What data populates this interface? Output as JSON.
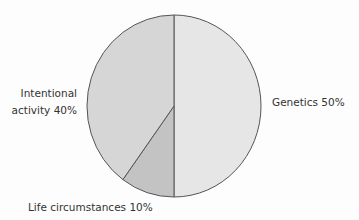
{
  "chart_data": {
    "type": "pie",
    "title": "",
    "center": {
      "cx": 174,
      "cy": 106
    },
    "radius": {
      "rx": 87,
      "ry": 91
    },
    "start_angle_deg": 0,
    "direction": "clockwise-from-top",
    "outline_color": "#555555",
    "text_color": "#333333",
    "slices": [
      {
        "name": "Genetics",
        "value": 50,
        "label": "Genetics 50%",
        "color": "#e6e6e6",
        "label_lines": [
          "Genetics 50%"
        ],
        "label_pos": {
          "x": 272,
          "y": 106,
          "anchor": "start"
        }
      },
      {
        "name": "Life circumstances",
        "value": 10,
        "label": "Life circumstances 10%",
        "color": "#c3c3c3",
        "label_lines": [
          "Life circumstances 10%"
        ],
        "label_pos": {
          "x": 28,
          "y": 211,
          "anchor": "start"
        }
      },
      {
        "name": "Intentional activity",
        "value": 40,
        "label": "Intentional activity 40%",
        "color": "#d6d6d6",
        "label_lines": [
          "Intentional",
          "activity 40%"
        ],
        "label_pos": {
          "x": 77,
          "y": 97,
          "anchor": "end",
          "line_height": 17
        }
      }
    ],
    "legend": null,
    "units": "%"
  }
}
